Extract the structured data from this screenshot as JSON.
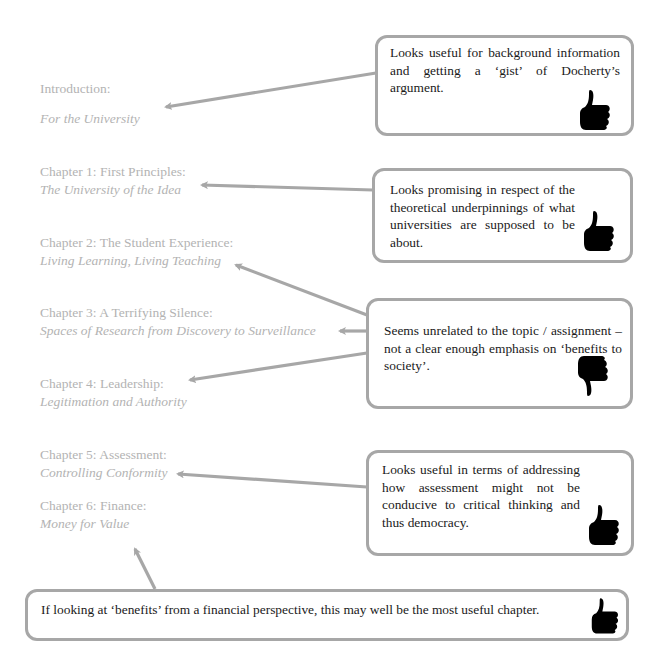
{
  "toc": {
    "intro": {
      "heading": "Introduction:",
      "sub": "For the University"
    },
    "ch1": {
      "heading": "Chapter 1: First Principles:",
      "sub": "The University of the Idea"
    },
    "ch2": {
      "heading": "Chapter 2: The Student Experience:",
      "sub": "Living Learning, Living Teaching"
    },
    "ch3": {
      "heading": "Chapter 3: A Terrifying Silence:",
      "sub": "Spaces of Research from Discovery to Surveillance"
    },
    "ch4": {
      "heading": "Chapter 4: Leadership:",
      "sub": "Legitimation and Authority"
    },
    "ch5": {
      "heading": "Chapter 5: Assessment:",
      "sub": "Controlling Conformity"
    },
    "ch6": {
      "heading": "Chapter 6: Finance:",
      "sub": "Money for Value"
    }
  },
  "notes": [
    {
      "text": "Looks useful for background information and getting a ‘gist’ of Docherty’s argument.",
      "icon": "thumbs-up",
      "targets": [
        "Introduction"
      ]
    },
    {
      "text": "Looks promising in respect of the theoretical underpinnings of what universities are supposed to be about.",
      "icon": "thumbs-up",
      "targets": [
        "Chapter 1"
      ]
    },
    {
      "text": "Seems unrelated to the topic / assignment – not a clear enough emphasis on ‘benefits to society’.",
      "icon": "thumbs-down",
      "targets": [
        "Chapter 2",
        "Chapter 3",
        "Chapter 4"
      ]
    },
    {
      "text": "Looks useful in terms of addressing how assessment might not be conducive to critical thinking and thus democracy.",
      "icon": "thumbs-up",
      "targets": [
        "Chapter 5"
      ]
    },
    {
      "text": "If looking at ‘benefits’ from a financial perspective, this may well be the most useful chapter.",
      "icon": "thumbs-up",
      "targets": [
        "Chapter 6"
      ]
    }
  ],
  "colors": {
    "toc_text": "#b3b3b3",
    "arrow": "#a7a7a7",
    "border": "#a7a7a7",
    "note_text": "#1a1a1a",
    "icon": "#000000"
  }
}
